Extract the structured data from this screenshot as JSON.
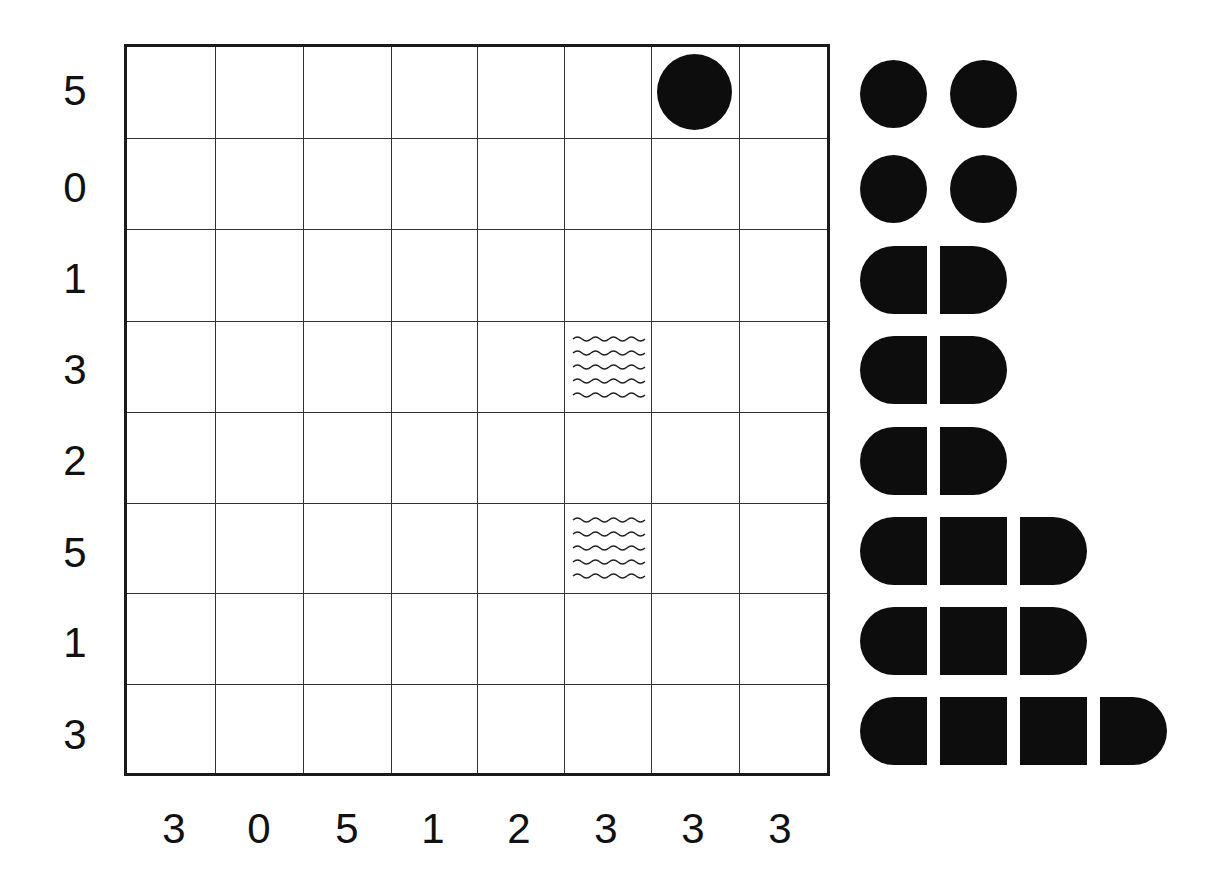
{
  "puzzle": {
    "type": "battleships",
    "grid_size": {
      "rows": 8,
      "cols": 8
    },
    "row_clues": [
      "5",
      "0",
      "1",
      "3",
      "2",
      "5",
      "1",
      "3"
    ],
    "col_clues": [
      "3",
      "0",
      "5",
      "1",
      "2",
      "3",
      "3",
      "3"
    ],
    "given_cells": [
      {
        "row": 0,
        "col": 5,
        "type": "submarine",
        "icon": "filled-circle-icon"
      },
      {
        "row": 3,
        "col": 4,
        "type": "water",
        "icon": "wave-icon"
      },
      {
        "row": 5,
        "col": 4,
        "type": "water",
        "icon": "wave-icon"
      }
    ],
    "fleet": [
      {
        "length": 1,
        "count": 2,
        "row_index": 0
      },
      {
        "length": 1,
        "count": 2,
        "row_index": 1
      },
      {
        "length": 2,
        "count": 1,
        "row_index": 2
      },
      {
        "length": 2,
        "count": 1,
        "row_index": 3
      },
      {
        "length": 2,
        "count": 1,
        "row_index": 4
      },
      {
        "length": 3,
        "count": 1,
        "row_index": 5
      },
      {
        "length": 3,
        "count": 1,
        "row_index": 6
      },
      {
        "length": 4,
        "count": 1,
        "row_index": 7
      }
    ]
  },
  "colors": {
    "ship": "#0d0d0d",
    "grid_line": "#333333",
    "border": "#1a1a1a",
    "background": "#ffffff"
  }
}
